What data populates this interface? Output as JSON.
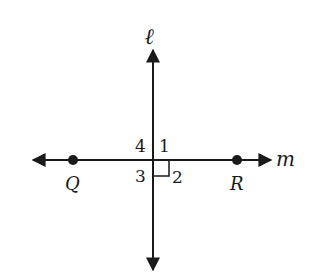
{
  "diagram": {
    "lines": {
      "vertical": {
        "label": "ℓ"
      },
      "horizontal": {
        "label": "m"
      }
    },
    "points": [
      {
        "label": "Q"
      },
      {
        "label": "R"
      }
    ],
    "angles": [
      {
        "label": "1",
        "position": "upper-right"
      },
      {
        "label": "2",
        "position": "lower-right",
        "right_angle_marker": true
      },
      {
        "label": "3",
        "position": "lower-left"
      },
      {
        "label": "4",
        "position": "upper-left"
      }
    ],
    "colors": {
      "stroke": "#1a1a1a",
      "background": "#ffffff"
    }
  }
}
